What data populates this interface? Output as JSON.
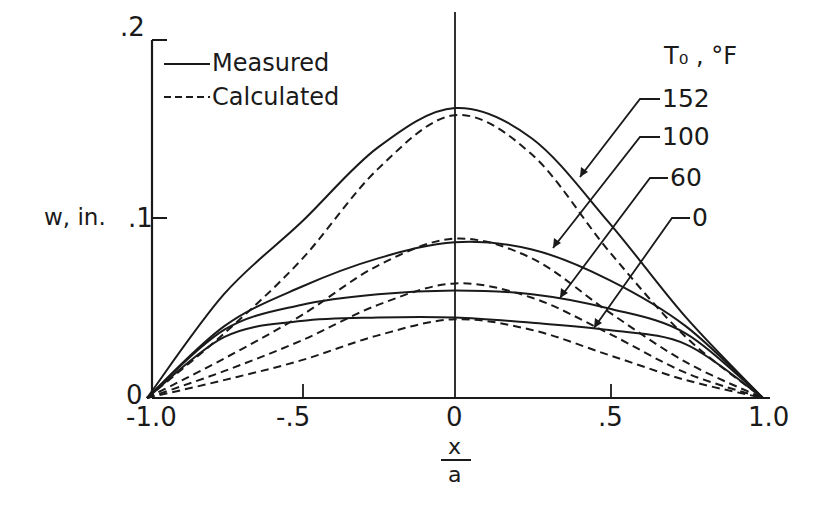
{
  "chart_data": {
    "type": "line",
    "title": "",
    "xlabel_num": "x",
    "xlabel_den": "a",
    "ylabel": "w, in.",
    "xlim": [
      -1.0,
      1.0
    ],
    "ylim": [
      0,
      0.2
    ],
    "x_ticks": [
      "-1.0",
      "-.5",
      "0",
      ".5",
      "1.0"
    ],
    "y_ticks": [
      "0",
      ".1",
      ".2"
    ],
    "grid": false,
    "legend": {
      "position": "upper-left",
      "entries": [
        {
          "label": "Measured",
          "style": "solid"
        },
        {
          "label": "Calculated",
          "style": "dashed"
        }
      ]
    },
    "annotation_title": "T₀ , °F",
    "x": [
      -1.0,
      -0.75,
      -0.5,
      -0.25,
      0.0,
      0.25,
      0.5,
      0.75,
      1.0
    ],
    "series": [
      {
        "name": "152 Measured",
        "temp": "152",
        "style": "solid",
        "values": [
          0,
          0.058,
          0.098,
          0.14,
          0.162,
          0.145,
          0.098,
          0.045,
          0
        ]
      },
      {
        "name": "152 Calculated",
        "temp": "152",
        "style": "dashed",
        "values": [
          0,
          0.036,
          0.077,
          0.128,
          0.158,
          0.136,
          0.082,
          0.034,
          0
        ]
      },
      {
        "name": "100 Measured",
        "temp": "100",
        "style": "solid",
        "values": [
          0,
          0.04,
          0.062,
          0.078,
          0.087,
          0.083,
          0.066,
          0.04,
          0
        ]
      },
      {
        "name": "100 Calculated",
        "temp": "100",
        "style": "dashed",
        "values": [
          0,
          0.022,
          0.046,
          0.074,
          0.089,
          0.078,
          0.048,
          0.02,
          0
        ]
      },
      {
        "name": "60 Measured",
        "temp": "60",
        "style": "solid",
        "values": [
          0,
          0.038,
          0.052,
          0.058,
          0.06,
          0.058,
          0.05,
          0.036,
          0
        ]
      },
      {
        "name": "60 Calculated",
        "temp": "60",
        "style": "dashed",
        "values": [
          0,
          0.015,
          0.032,
          0.052,
          0.064,
          0.056,
          0.036,
          0.014,
          0
        ]
      },
      {
        "name": "0 Measured",
        "temp": "0",
        "style": "solid",
        "values": [
          0,
          0.034,
          0.043,
          0.045,
          0.045,
          0.042,
          0.038,
          0.03,
          0
        ]
      },
      {
        "name": "0 Calculated",
        "temp": "0",
        "style": "dashed",
        "values": [
          0,
          0.01,
          0.021,
          0.035,
          0.044,
          0.038,
          0.024,
          0.01,
          0
        ]
      }
    ],
    "curve_labels": [
      "152",
      "100",
      "60",
      "0"
    ]
  }
}
